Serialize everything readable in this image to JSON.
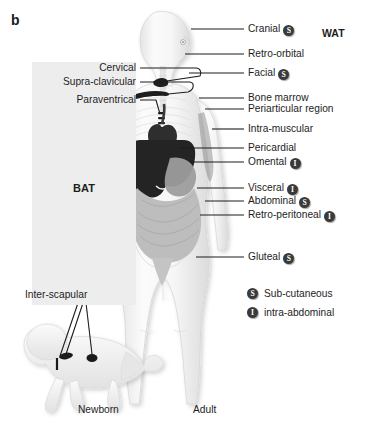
{
  "figure": {
    "panel_letter": "b",
    "region_labels": {
      "bat": "BAT",
      "wat": "WAT"
    },
    "captions": {
      "newborn": "Newborn",
      "adult": "Adult"
    },
    "badge_letters": {
      "subcutaneous": "S",
      "intraabdominal": "I"
    }
  },
  "left_labels": [
    {
      "text": "Cervical",
      "y": 68
    },
    {
      "text": "Supra-clavicular",
      "y": 82
    },
    {
      "text": "Paraventrical",
      "y": 100
    }
  ],
  "newborn_label": {
    "text": "Inter-scapular"
  },
  "right_labels": [
    {
      "text": "Cranial",
      "badge": "S",
      "y": 29
    },
    {
      "text": "Retro-orbital",
      "badge": null,
      "y": 54
    },
    {
      "text": "Facial",
      "badge": "S",
      "y": 73
    },
    {
      "text": "Bone marrow",
      "badge": null,
      "y": 98
    },
    {
      "text": "Periarticular region",
      "badge": null,
      "y": 109
    },
    {
      "text": "Intra-muscular",
      "badge": null,
      "y": 129
    },
    {
      "text": "Pericardial",
      "badge": null,
      "y": 148
    },
    {
      "text": "Omental",
      "badge": "I",
      "y": 162
    },
    {
      "text": "Visceral",
      "badge": "I",
      "y": 188
    },
    {
      "text": "Abdominal",
      "badge": "S",
      "y": 201
    },
    {
      "text": "Retro-peritoneal",
      "badge": "I",
      "y": 215
    },
    {
      "text": "Gluteal",
      "badge": "S",
      "y": 257
    }
  ],
  "legend": [
    {
      "badge": "S",
      "text": "Sub-cutaneous"
    },
    {
      "badge": "I",
      "text": "intra-abdominal"
    }
  ],
  "colors": {
    "bat_panel": "#ededed",
    "badge_fill": "#3a3a3a",
    "text": "#1d1d1d",
    "leader_line": "#1d1d1d",
    "body_fill": "#f2f2f2",
    "body_stroke": "#d8d8d8",
    "liver": "#262626",
    "heart": "#303030",
    "intestine": "#b9b9b9",
    "stomach": "#9a9a9a"
  }
}
